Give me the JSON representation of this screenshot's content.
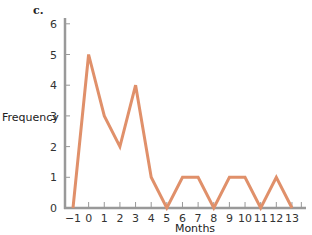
{
  "panel_label": "c.",
  "colors": {
    "line": "#e0906a",
    "axis": "#999999",
    "text": "#222222"
  },
  "chart_data": {
    "type": "line",
    "title": "",
    "panel_label": "c.",
    "xlabel": "Months",
    "ylabel": "Frequency",
    "x": [
      -1,
      0,
      1,
      2,
      3,
      4,
      5,
      6,
      7,
      8,
      9,
      10,
      11,
      12,
      13
    ],
    "series": [
      {
        "name": "Frequency",
        "values": [
          0,
          5,
          3,
          2,
          4,
          1,
          0,
          1,
          1,
          0,
          1,
          1,
          0,
          1,
          0
        ]
      }
    ],
    "x_ticks": [
      "-1",
      "0",
      "1",
      "2",
      "3",
      "4",
      "5",
      "6",
      "7",
      "8",
      "9",
      "10",
      "11",
      "12",
      "13"
    ],
    "y_ticks": [
      "0",
      "1",
      "2",
      "3",
      "4",
      "5",
      "6"
    ],
    "xlim": [
      -1,
      13
    ],
    "ylim": [
      0,
      6
    ],
    "grid": false,
    "legend": null
  }
}
